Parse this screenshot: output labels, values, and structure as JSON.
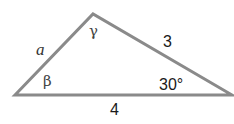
{
  "diagram": {
    "type": "triangle",
    "stroke_color": "#8a8a8a",
    "vertices": {
      "left": [
        15,
        95
      ],
      "top": [
        93,
        14
      ],
      "right": [
        232,
        95
      ]
    },
    "sides": {
      "left_side": "a",
      "right_side": "3",
      "bottom_side": "4"
    },
    "angles": {
      "top": "γ",
      "left": "β",
      "right": "30°"
    }
  }
}
